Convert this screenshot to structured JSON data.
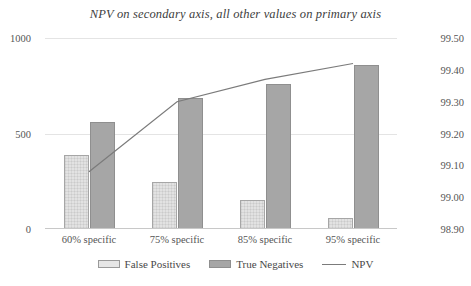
{
  "chart_data": {
    "type": "bar",
    "title": "NPV on secondary axis, all other values on primary axis",
    "xlabel": "",
    "ylabel": "",
    "categories": [
      "60% specific",
      "75% specific",
      "85% specific",
      "95% specific"
    ],
    "series": [
      {
        "name": "False Positives",
        "type": "bar",
        "axis": "primary",
        "color": "#E2E2E2",
        "values": [
          387,
          246,
          152,
          58
        ]
      },
      {
        "name": "True Negatives",
        "type": "bar",
        "axis": "primary",
        "color": "#A6A6A6",
        "values": [
          560,
          686,
          759,
          858
        ]
      },
      {
        "name": "NPV",
        "type": "line",
        "axis": "secondary",
        "color": "#7B7B7B",
        "values": [
          99.08,
          99.3,
          99.37,
          99.42
        ]
      }
    ],
    "primary_axis": {
      "ylim": [
        0,
        1000
      ],
      "ticks": [
        0,
        500,
        1000
      ],
      "tick_labels": [
        "0",
        "500",
        "1000"
      ]
    },
    "secondary_axis": {
      "ylim": [
        98.9,
        99.5
      ],
      "ticks": [
        98.9,
        99.0,
        99.1,
        99.2,
        99.3,
        99.4,
        99.5
      ],
      "tick_labels": [
        "98.90",
        "99.00",
        "99.10",
        "99.20",
        "99.30",
        "99.40",
        "99.50"
      ]
    },
    "grid": true,
    "legend_position": "bottom"
  },
  "legend": {
    "items": [
      {
        "label": "False Positives"
      },
      {
        "label": "True Negatives"
      },
      {
        "label": "NPV"
      }
    ]
  }
}
